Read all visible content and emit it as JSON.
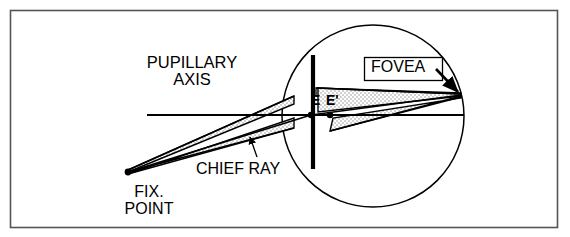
{
  "figure": {
    "frame": {
      "stroke": "#555555",
      "x": 10,
      "y": 10,
      "width": 548,
      "height": 218
    },
    "colors": {
      "line": "#000000",
      "frame": "#555555",
      "stipple": "#9a9a9a",
      "background": "#ffffff"
    },
    "labels": {
      "pupillary_axis_line1": "PUPILLARY",
      "pupillary_axis_line2": "AXIS",
      "fovea": "FOVEA",
      "chief_ray": "CHIEF RAY",
      "fix_point_line1": "FIX.",
      "fix_point_line2": "POINT",
      "entrance_pupil": "E",
      "exit_pupil": "E'"
    },
    "geometry": {
      "eyeball_circle": {
        "cx": 373,
        "cy": 116,
        "r": 91
      },
      "iris_line": {
        "x": 313,
        "y_top": 55,
        "y_bottom": 169,
        "stroke_width": 4
      },
      "pupillary_axis": {
        "x1": 147,
        "y": 115,
        "x2": 464
      },
      "fovea_point": {
        "x": 461,
        "y": 95
      },
      "fixation_point": {
        "x": 128,
        "y": 172
      },
      "node_E": {
        "x": 311,
        "y": 115
      },
      "node_E_prime": {
        "x": 330,
        "y": 115
      }
    }
  }
}
